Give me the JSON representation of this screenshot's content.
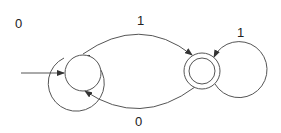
{
  "diagram": {
    "type": "finite-automaton",
    "states": [
      {
        "id": "q0",
        "initial": true,
        "accepting": false
      },
      {
        "id": "q1",
        "initial": false,
        "accepting": true
      }
    ],
    "transitions": [
      {
        "from": "q0",
        "to": "q0",
        "label": "0"
      },
      {
        "from": "q0",
        "to": "q1",
        "label": "1"
      },
      {
        "from": "q1",
        "to": "q1",
        "label": "1"
      },
      {
        "from": "q1",
        "to": "q0",
        "label": "0"
      }
    ],
    "labels": {
      "loop_q0": "0",
      "q0_to_q1": "1",
      "loop_q1": "1",
      "q1_to_q0": "0"
    }
  }
}
